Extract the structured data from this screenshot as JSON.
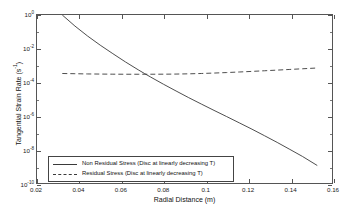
{
  "chart_data": {
    "type": "line",
    "title": "",
    "xlabel": "Radial Distance (m)",
    "ylabel": "Tangential Strain Rate (s⁻¹)",
    "ylabel_base": "Tangential Strain Rate (s",
    "ylabel_exp": "-1",
    "ylabel_tail": ")",
    "xscale": "linear",
    "yscale": "log",
    "xlim": [
      0.02,
      0.16
    ],
    "ylim": [
      1e-10,
      1
    ],
    "grid": false,
    "legend_position": "lower left",
    "xticks": [
      0.02,
      0.04,
      0.06,
      0.08,
      0.1,
      0.12,
      0.14,
      0.16
    ],
    "xtick_labels": [
      "0.02",
      "0.04",
      "0.06",
      "0.08",
      "0.1",
      "0.12",
      "0.14",
      "0.16"
    ],
    "yticks": [
      1,
      0.01,
      0.0001,
      1e-06,
      1e-08,
      1e-10
    ],
    "ytick_labels": [
      "10",
      "10",
      "10",
      "10",
      "10",
      "10"
    ],
    "ytick_exponents": [
      "0",
      "-2",
      "-4",
      "-6",
      "-8",
      "-10"
    ],
    "series": [
      {
        "name": "Non Residual Stress (Disc at linearly decreasing T)",
        "style": "solid",
        "color": "#3a3a3a",
        "x": [
          0.032,
          0.038,
          0.044,
          0.05,
          0.056,
          0.062,
          0.068,
          0.071,
          0.074,
          0.08,
          0.086,
          0.092,
          0.098,
          0.104,
          0.11,
          0.116,
          0.122,
          0.128,
          0.134,
          0.14,
          0.146,
          0.153
        ],
        "y": [
          1.0,
          0.22,
          0.056,
          0.016,
          0.005,
          0.0016,
          0.00055,
          0.00033,
          0.0002,
          7.6e-05,
          3e-05,
          1.2e-05,
          5e-06,
          2.1e-06,
          9e-07,
          3.8e-07,
          1.6e-07,
          6.5e-08,
          2.6e-08,
          1e-08,
          3.8e-09,
          1.1e-09
        ]
      },
      {
        "name": "Residual Stress (Disc at linearly decreasing T)",
        "style": "dashed",
        "color": "#3a3a3a",
        "x": [
          0.032,
          0.038,
          0.044,
          0.05,
          0.056,
          0.062,
          0.068,
          0.074,
          0.08,
          0.086,
          0.092,
          0.098,
          0.104,
          0.11,
          0.116,
          0.122,
          0.128,
          0.134,
          0.14,
          0.146,
          0.153
        ],
        "y": [
          0.00033,
          0.00032,
          0.00031,
          0.000305,
          0.0003,
          0.000298,
          0.000297,
          0.000298,
          0.0003,
          0.000305,
          0.000315,
          0.00033,
          0.00035,
          0.000375,
          0.000405,
          0.00044,
          0.00048,
          0.000525,
          0.000575,
          0.00063,
          0.0007
        ]
      }
    ]
  },
  "legend": {
    "entries": [
      {
        "label": "Non Residual Stress (Disc at linearly decreasing T)",
        "style": "solid"
      },
      {
        "label": "Residual Stress (Disc at linearly decreasing T)",
        "style": "dashed"
      }
    ]
  }
}
